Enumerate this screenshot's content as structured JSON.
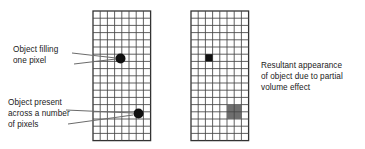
{
  "figure": {
    "background_color": "#ffffff",
    "line_color": "#333333",
    "object_color": "#111111",
    "partial_fill_color": "#6e6e6e",
    "text_color": "#1a1a1a"
  },
  "labels": {
    "left_top": "Object filling\none pixel",
    "left_bottom": "Object present\nacross a number\nof pixels",
    "right": "Resultant appearance\nof object due to partial\nvolume effect"
  },
  "grids": {
    "left": {
      "name": "object-grid",
      "x": 93,
      "y": 11,
      "columns": 8,
      "rows": 18,
      "cell": 7.2
    },
    "right": {
      "name": "image-grid",
      "x": 191,
      "y": 11,
      "columns": 8,
      "rows": 18,
      "cell": 7.2
    }
  },
  "markers": {
    "left_grid_dot_upper": {
      "cx": 120.5,
      "cy": 58.5,
      "r": 5.0
    },
    "left_grid_dot_lower": {
      "cx": 138.5,
      "cy": 113.5,
      "r": 5.0
    },
    "right_grid_black_square": {
      "col": 2,
      "row": 6,
      "span": 1
    },
    "right_grid_gray_square": {
      "col": 5,
      "row": 13,
      "span": 2
    }
  },
  "leaders": {
    "left_top": [
      {
        "x1": 72,
        "y1": 53,
        "x2": 116,
        "y2": 58
      },
      {
        "x1": 74,
        "y1": 64,
        "x2": 116,
        "y2": 59
      }
    ],
    "left_bottom": [
      {
        "x1": 66,
        "y1": 110,
        "x2": 133,
        "y2": 113
      },
      {
        "x1": 68,
        "y1": 124,
        "x2": 133,
        "y2": 115
      }
    ]
  }
}
